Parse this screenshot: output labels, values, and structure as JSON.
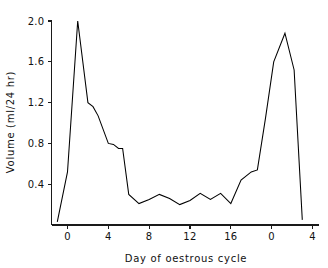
{
  "chart_data": {
    "type": "line",
    "title": "",
    "xlabel": "Day of oestrous cycle",
    "ylabel": "Volume (ml/24 hr)",
    "xlim": [
      -1.6,
      4.4
    ],
    "ylim": [
      0.0,
      2.08
    ],
    "grid": false,
    "legend": null,
    "x_tick_labels": [
      "0",
      "4",
      "8",
      "12",
      "16",
      "0",
      "4"
    ],
    "x_tick_values": [
      0,
      4,
      8,
      12,
      16,
      20,
      24
    ],
    "y_tick_labels": [
      "0.4",
      "0.8",
      "1.2",
      "1.6",
      "2.0"
    ],
    "y_tick_values": [
      0.4,
      0.8,
      1.2,
      1.6,
      2.0
    ],
    "x_axis_note": "second cycle restarts numbering at 0 after day 16 (plotted continuously as 20 and 24)",
    "x": [
      -1.0,
      0.0,
      1.0,
      2.0,
      2.5,
      3.0,
      4.0,
      4.5,
      5.0,
      5.4,
      6.0,
      7.0,
      8.0,
      9.0,
      10.0,
      11.0,
      12.0,
      13.0,
      14.0,
      15.0,
      16.0,
      17.0,
      18.0,
      18.6,
      19.4,
      20.2,
      21.3,
      22.2,
      23.0
    ],
    "y": [
      0.03,
      0.52,
      2.0,
      1.2,
      1.16,
      1.07,
      0.8,
      0.79,
      0.75,
      0.75,
      0.3,
      0.21,
      0.25,
      0.3,
      0.26,
      0.2,
      0.24,
      0.31,
      0.25,
      0.31,
      0.21,
      0.44,
      0.52,
      0.54,
      1.05,
      1.6,
      1.88,
      1.52,
      0.05
    ],
    "series": [
      {
        "name": "Volume",
        "x": [
          -1.0,
          0.0,
          1.0,
          2.0,
          2.5,
          3.0,
          4.0,
          4.5,
          5.0,
          5.4,
          6.0,
          7.0,
          8.0,
          9.0,
          10.0,
          11.0,
          12.0,
          13.0,
          14.0,
          15.0,
          16.0,
          17.0,
          18.0,
          18.6,
          19.4,
          20.2,
          21.3,
          22.2,
          23.0
        ],
        "values": [
          0.03,
          0.52,
          2.0,
          1.2,
          1.16,
          1.07,
          0.8,
          0.79,
          0.75,
          0.75,
          0.3,
          0.21,
          0.25,
          0.3,
          0.26,
          0.2,
          0.24,
          0.31,
          0.25,
          0.31,
          0.21,
          0.44,
          0.52,
          0.54,
          1.05,
          1.6,
          1.88,
          1.52,
          0.05
        ]
      }
    ],
    "annotations": [],
    "colors": {
      "line": "#000000",
      "axis": "#1a1a1a",
      "text": "#111111",
      "background": "#ffffff"
    }
  }
}
